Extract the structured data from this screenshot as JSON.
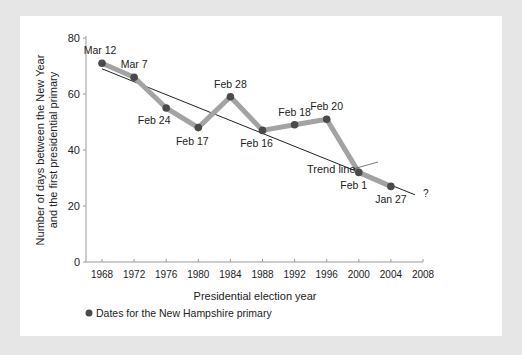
{
  "chart_data": {
    "type": "line",
    "title": "",
    "xlabel": "Presidential election year",
    "ylabel": "Number of days between the New Year and the first presidential primary",
    "ylabel_lines": [
      "Number of days between the New Year",
      "and the first presidential primary"
    ],
    "x_ticks": [
      1968,
      1972,
      1976,
      1980,
      1984,
      1988,
      1992,
      1996,
      2000,
      2004,
      2008
    ],
    "y_ticks": [
      0,
      20,
      40,
      60,
      80
    ],
    "ylim": [
      0,
      80
    ],
    "xlim": [
      1966.3,
      2008
    ],
    "grid": false,
    "series": [
      {
        "name": "Dates for the New Hampshire primary",
        "x": [
          1968,
          1972,
          1976,
          1980,
          1984,
          1988,
          1992,
          1996,
          2000,
          2004
        ],
        "values": [
          71,
          66,
          55,
          48,
          59,
          47,
          49,
          51,
          32,
          27
        ],
        "labels": [
          "Mar 12",
          "Mar 7",
          "Feb 24",
          "Feb 17",
          "Feb 28",
          "Feb 16",
          "Feb 18",
          "Feb 20",
          "Feb 1",
          "Jan 27"
        ]
      }
    ],
    "trend_line": {
      "label": "Trend line",
      "x": [
        1968,
        2007
      ],
      "values": [
        69,
        24
      ],
      "end_annotation": "?"
    },
    "legend": {
      "position": "bottom-left",
      "entries": [
        "Dates for the New Hampshire primary"
      ]
    }
  },
  "colors": {
    "line": "#a3a3a3",
    "marker": "#4a4a4a",
    "trend": "#222222",
    "background": "#e6e6e6",
    "panel": "#ffffff"
  }
}
